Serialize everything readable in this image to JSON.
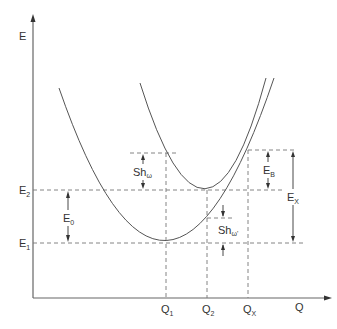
{
  "diagram": {
    "axes": {
      "y_label": "E",
      "x_label": "Q"
    },
    "energy_levels": [
      {
        "id": "E2",
        "main": "E",
        "sub": "2"
      },
      {
        "id": "E1",
        "main": "E",
        "sub": "1"
      }
    ],
    "coordinates": [
      {
        "id": "Q1",
        "main": "Q",
        "sub": "1"
      },
      {
        "id": "Q2",
        "main": "Q",
        "sub": "2"
      },
      {
        "id": "QX",
        "main": "Q",
        "sub": "X"
      }
    ],
    "annotations": {
      "e0": {
        "main": "E",
        "sub": "0"
      },
      "sh_upper": {
        "main": "Sh",
        "sub": "ω"
      },
      "sh_lower": {
        "main": "Sh",
        "sub": "ω'"
      },
      "eb": {
        "main": "E",
        "sub": "B"
      },
      "ex": {
        "main": "E",
        "sub": "X"
      }
    },
    "curves": [
      {
        "name": "ground-state-parabola",
        "minimum": "Q1,E1"
      },
      {
        "name": "excited-state-parabola",
        "minimum": "Q2,E2"
      }
    ],
    "colors": {
      "line": "#555555",
      "text": "#333333"
    }
  }
}
